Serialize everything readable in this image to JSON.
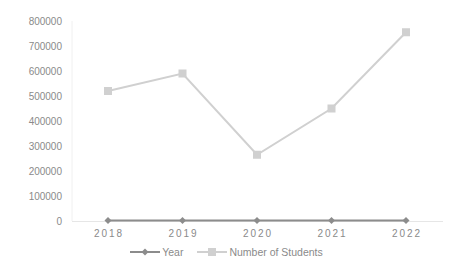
{
  "chart_data": {
    "type": "line",
    "title": "",
    "xlabel": "",
    "ylabel": "",
    "categories": [
      "2018",
      "2019",
      "2020",
      "2021",
      "2022"
    ],
    "series": [
      {
        "name": "Year",
        "values": [
          2018,
          2019,
          2020,
          2021,
          2022
        ],
        "color": "#8c8c8c",
        "marker": "diamond"
      },
      {
        "name": "Number of Students",
        "values": [
          520000,
          590000,
          265000,
          450000,
          755000
        ],
        "color": "#d0d0d0",
        "marker": "square"
      }
    ],
    "ylim": [
      0,
      800000
    ],
    "yticks": [
      "0",
      "100000",
      "200000",
      "300000",
      "400000",
      "500000",
      "600000",
      "700000",
      "800000"
    ],
    "grid": false,
    "legend_position": "bottom"
  },
  "legend": {
    "items": [
      {
        "label": "Year"
      },
      {
        "label": "Number of Students"
      }
    ]
  }
}
